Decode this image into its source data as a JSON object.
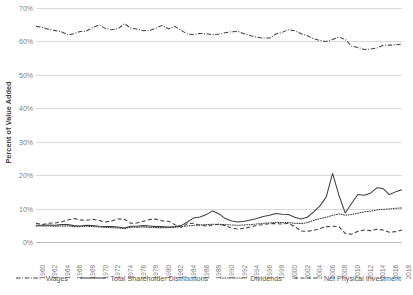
{
  "chart_data": {
    "type": "line",
    "title": "",
    "xlabel": "",
    "ylabel": "Percent of Value Added",
    "ylim": [
      0,
      70
    ],
    "ytick_labels": [
      "0%",
      "10%",
      "20%",
      "30%",
      "40%",
      "50%",
      "60%",
      "70%"
    ],
    "ytick_values": [
      0,
      10,
      20,
      30,
      40,
      50,
      60,
      70
    ],
    "grid": true,
    "legend_position": "bottom",
    "xlim": [
      1960,
      2018
    ],
    "x": [
      1960,
      1961,
      1962,
      1963,
      1964,
      1965,
      1966,
      1967,
      1968,
      1969,
      1970,
      1971,
      1972,
      1973,
      1974,
      1975,
      1976,
      1977,
      1978,
      1979,
      1980,
      1981,
      1982,
      1983,
      1984,
      1985,
      1986,
      1987,
      1988,
      1989,
      1990,
      1991,
      1992,
      1993,
      1994,
      1995,
      1996,
      1997,
      1998,
      1999,
      2000,
      2001,
      2002,
      2003,
      2004,
      2005,
      2006,
      2007,
      2008,
      2009,
      2010,
      2011,
      2012,
      2013,
      2014,
      2015,
      2016,
      2017,
      2018
    ],
    "xtick_labels": [
      "1960",
      "1962",
      "1964",
      "1966",
      "1968",
      "1970",
      "1972",
      "1974",
      "1976",
      "1978",
      "1980",
      "1982",
      "1984",
      "1986",
      "1988",
      "1990",
      "1992",
      "1994",
      "1996",
      "1998",
      "2000",
      "2002",
      "2004",
      "2006",
      "2008",
      "2010",
      "2012",
      "2014",
      "2016",
      "2018"
    ],
    "series": [
      {
        "name": "Wages",
        "line_style": "dash-dot",
        "color": "#404040",
        "values": [
          64.5,
          64.2,
          63.6,
          63.3,
          62.9,
          62.0,
          62.3,
          63.0,
          63.1,
          64.2,
          64.9,
          63.9,
          63.5,
          63.8,
          65.3,
          64.0,
          63.7,
          63.2,
          63.3,
          64.0,
          64.8,
          63.8,
          64.5,
          63.3,
          62.2,
          62.1,
          62.4,
          62.3,
          62.0,
          62.2,
          62.6,
          62.9,
          63.0,
          62.3,
          61.7,
          61.3,
          61.0,
          61.0,
          62.2,
          62.7,
          63.5,
          63.2,
          62.3,
          61.7,
          60.8,
          60.3,
          60.0,
          60.6,
          61.3,
          60.6,
          58.6,
          58.2,
          57.6,
          57.7,
          58.0,
          58.8,
          58.9,
          59.0,
          59.2
        ]
      },
      {
        "name": "Total Shareholder Distributions",
        "line_style": "solid",
        "color": "#404040",
        "values": [
          5.0,
          5.0,
          5.1,
          5.0,
          5.2,
          5.2,
          4.9,
          4.8,
          5.0,
          4.9,
          4.7,
          4.6,
          4.6,
          4.5,
          4.2,
          4.7,
          4.7,
          4.9,
          4.8,
          4.6,
          4.6,
          4.5,
          4.6,
          4.9,
          6.0,
          7.2,
          7.5,
          8.2,
          9.3,
          8.4,
          7.0,
          6.3,
          6.0,
          6.2,
          6.6,
          7.0,
          7.6,
          8.0,
          8.5,
          8.3,
          8.2,
          7.4,
          6.9,
          7.4,
          9.0,
          10.8,
          13.5,
          20.5,
          14.0,
          8.7,
          11.5,
          14.2,
          14.0,
          14.6,
          16.2,
          16.0,
          14.2,
          15.0,
          15.6
        ]
      },
      {
        "name": "Dividends",
        "line_style": "dotted",
        "color": "#595959",
        "values": [
          4.8,
          4.8,
          4.8,
          4.7,
          4.8,
          4.8,
          4.6,
          4.6,
          4.7,
          4.6,
          4.5,
          4.4,
          4.3,
          4.2,
          4.0,
          4.4,
          4.4,
          4.5,
          4.4,
          4.3,
          4.3,
          4.3,
          4.4,
          4.6,
          4.8,
          5.0,
          5.1,
          5.2,
          5.3,
          5.3,
          5.2,
          5.1,
          5.0,
          5.1,
          5.2,
          5.4,
          5.6,
          5.7,
          5.9,
          5.8,
          5.8,
          5.6,
          5.5,
          5.8,
          6.5,
          7.0,
          7.4,
          8.0,
          8.4,
          8.0,
          8.2,
          8.6,
          9.0,
          9.2,
          9.6,
          9.8,
          9.9,
          10.1,
          10.2
        ]
      },
      {
        "name": "Net Physical Investment",
        "line_style": "dashed",
        "color": "#404040",
        "values": [
          5.6,
          5.2,
          5.6,
          5.7,
          6.0,
          6.6,
          7.0,
          6.6,
          6.5,
          6.8,
          6.4,
          6.0,
          6.3,
          6.9,
          6.8,
          5.6,
          5.7,
          6.2,
          6.7,
          6.9,
          6.3,
          6.2,
          5.2,
          4.4,
          5.5,
          5.6,
          5.0,
          4.8,
          5.1,
          5.3,
          4.9,
          4.1,
          3.9,
          4.1,
          4.5,
          5.0,
          5.2,
          5.5,
          5.5,
          5.4,
          5.6,
          4.6,
          3.3,
          3.2,
          3.5,
          4.0,
          4.6,
          4.7,
          4.6,
          2.6,
          2.3,
          3.2,
          3.6,
          3.4,
          3.8,
          3.6,
          2.9,
          3.1,
          3.6
        ]
      }
    ]
  },
  "legend": {
    "items": [
      {
        "label": "Wages",
        "style": "dash-dot"
      },
      {
        "label": "Total Shareholder Distributions",
        "style": "solid"
      },
      {
        "label": "Dividends",
        "style": "dotted"
      },
      {
        "label": "Net Physical Investment",
        "style": "dashed"
      }
    ]
  }
}
